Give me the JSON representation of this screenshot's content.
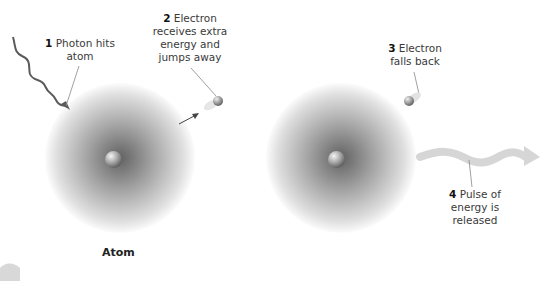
{
  "diagram": {
    "labels": [
      {
        "num": "1",
        "text_line1": "Photon hits",
        "text_line2": "atom"
      },
      {
        "num": "2",
        "text_line1": "Electron",
        "text_line2": "receives extra",
        "text_line3": "energy and",
        "text_line4": "jumps away"
      },
      {
        "num": "3",
        "text_line1": "Electron",
        "text_line2": "falls back"
      },
      {
        "num": "4",
        "text_line1": "Pulse of",
        "text_line2": "energy is",
        "text_line3": "released"
      }
    ],
    "caption": "Atom",
    "colors": {
      "wave_photon": "#5a5a5a",
      "wave_pulse": "#d4d4d4",
      "leader_line": "#888888",
      "text": "#3a3a3a"
    }
  }
}
